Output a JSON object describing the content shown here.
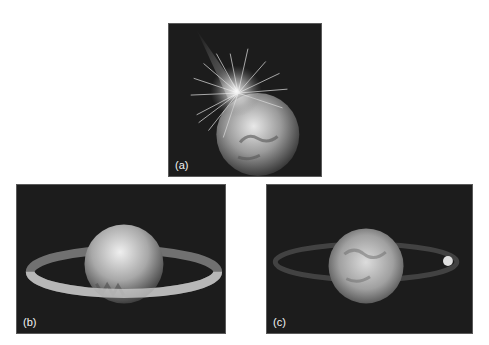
{
  "figure": {
    "panels": [
      {
        "id": "a",
        "label": "(a)",
        "description": "Impact of a large body with a planet, ejecting debris"
      },
      {
        "id": "b",
        "label": "(b)",
        "description": "Debris forming a ring around the planet"
      },
      {
        "id": "c",
        "label": "(c)",
        "description": "Planet with faint ring and a newly formed moon"
      }
    ]
  }
}
